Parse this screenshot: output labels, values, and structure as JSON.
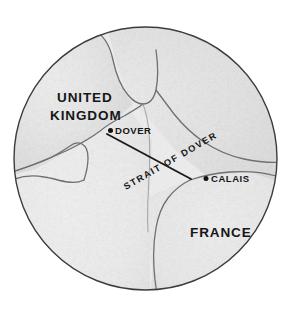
{
  "figure": {
    "kind": "circular-inset-map",
    "title_visible": false,
    "background_color": "#ffffff",
    "frame": {
      "shape": "circle",
      "center_x": 145.5,
      "center_y": 158.5,
      "radius": 131.5,
      "outline_color": "#3c3c3c",
      "outline_width": 1.4,
      "fill_color": "#f2f2f2"
    }
  },
  "map": {
    "style": "grayscale shaded relief",
    "land_color": "#e9e9e9",
    "sea_color": "#f7f7f7",
    "coastline_color": "#6b6b6b",
    "labels": {
      "united_kingdom": "UNITED\nKINGDOM",
      "united_kingdom_line1": "UNITED",
      "united_kingdom_line2": "KINGDOM",
      "france": "FRANCE",
      "dover": "DOVER",
      "calais": "CALAIS",
      "strait": "STRAIT OF DOVER"
    },
    "cities": [
      {
        "name": "DOVER",
        "marker_x": 110,
        "marker_y": 130,
        "label_x": 116,
        "label_y": 133
      },
      {
        "name": "CALAIS",
        "marker_x": 206,
        "marker_y": 179,
        "label_x": 212,
        "label_y": 182
      }
    ],
    "connector": {
      "name": "strait-of-dover-line",
      "from": "DOVER",
      "to": "CALAIS",
      "x1": 107,
      "y1": 134,
      "x2": 191,
      "y2": 179,
      "color": "#1a1a1a",
      "width": 1.8
    },
    "strait_label_rotation_deg": -30
  }
}
